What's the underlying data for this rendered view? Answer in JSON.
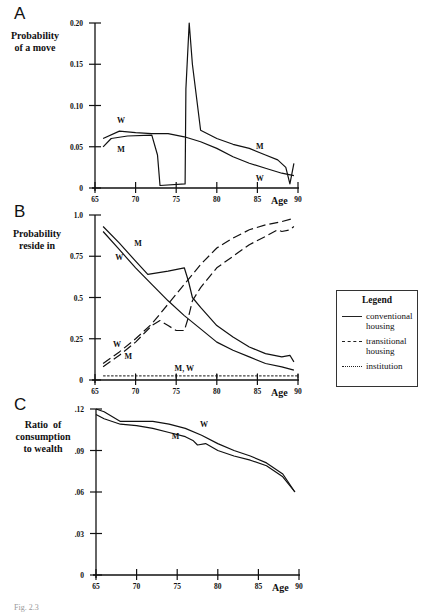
{
  "panels": {
    "A": {
      "letter": "A",
      "ylabel_lines": [
        "Probability",
        "of a move"
      ]
    },
    "B": {
      "letter": "B",
      "ylabel_lines": [
        "Probability",
        "reside in"
      ]
    },
    "C": {
      "letter": "C",
      "ylabel_lines": [
        "Ratio  of",
        "consumption",
        "to wealth"
      ]
    }
  },
  "legend": {
    "title": "Legend",
    "items": [
      {
        "style": "solid",
        "label_lines": [
          "conventional",
          "housing"
        ]
      },
      {
        "style": "dashed",
        "label_lines": [
          "transitional",
          "housing"
        ]
      },
      {
        "style": "dotted",
        "label_lines": [
          "institution"
        ]
      }
    ]
  },
  "chart_data": [
    {
      "type": "line",
      "panel": "A",
      "title": "",
      "ylabel": "Probability of a move",
      "xlabel": "Age",
      "xlim": [
        65,
        90
      ],
      "ylim": [
        0,
        0.2
      ],
      "x_ticks": [
        "65",
        "70",
        "75",
        "80",
        "85",
        "90"
      ],
      "y_ticks": [
        "0",
        "0.05",
        "0.10",
        "0.15",
        "0.20"
      ],
      "grid": false,
      "series": [
        {
          "name": "W",
          "x": [
            66,
            68,
            70,
            72,
            74,
            76,
            78,
            80,
            82,
            84,
            86,
            88,
            89.5
          ],
          "values": [
            0.06,
            0.069,
            0.067,
            0.066,
            0.066,
            0.062,
            0.056,
            0.048,
            0.038,
            0.03,
            0.024,
            0.018,
            0.015
          ]
        },
        {
          "name": "M",
          "x": [
            66,
            67,
            69,
            72,
            72.7,
            73,
            76.1,
            76.2,
            76.6,
            77,
            78,
            80,
            82,
            84,
            86,
            87.5,
            88.5,
            89,
            89.5
          ],
          "values": [
            0.05,
            0.06,
            0.063,
            0.064,
            0.04,
            0.003,
            0.005,
            0.12,
            0.2,
            0.15,
            0.07,
            0.06,
            0.053,
            0.048,
            0.04,
            0.034,
            0.025,
            0.005,
            0.03
          ]
        }
      ]
    },
    {
      "type": "line",
      "panel": "B",
      "ylabel": "Probability reside in",
      "xlabel": "Age",
      "xlim": [
        65,
        90
      ],
      "ylim": [
        0,
        1.0
      ],
      "x_ticks": [
        "65",
        "70",
        "75",
        "80",
        "85",
        "90"
      ],
      "y_ticks": [
        "0",
        "0.25",
        "0.5",
        "0.75",
        "1.0"
      ],
      "grid": false,
      "annotations": [
        "M",
        "W",
        "W",
        "M",
        "M, W"
      ],
      "series": [
        {
          "name": "M conventional housing",
          "style": "solid",
          "x": [
            66,
            68,
            70,
            71.5,
            74,
            76,
            76.5,
            77,
            78,
            80,
            82,
            84,
            86,
            88,
            89,
            89.5
          ],
          "values": [
            0.93,
            0.83,
            0.72,
            0.64,
            0.66,
            0.68,
            0.6,
            0.5,
            0.44,
            0.33,
            0.26,
            0.2,
            0.16,
            0.14,
            0.15,
            0.11
          ]
        },
        {
          "name": "W conventional housing",
          "style": "solid",
          "x": [
            66,
            68,
            70,
            72,
            74,
            76,
            78,
            80,
            82,
            84,
            86,
            88,
            89.5
          ],
          "values": [
            0.9,
            0.79,
            0.68,
            0.58,
            0.48,
            0.39,
            0.31,
            0.23,
            0.18,
            0.14,
            0.1,
            0.08,
            0.06
          ]
        },
        {
          "name": "W transitional housing",
          "style": "dashed",
          "x": [
            66,
            68,
            70,
            72,
            74,
            76,
            78,
            80,
            82,
            84,
            86,
            88,
            89.5
          ],
          "values": [
            0.1,
            0.17,
            0.25,
            0.34,
            0.46,
            0.58,
            0.7,
            0.8,
            0.86,
            0.91,
            0.94,
            0.96,
            0.98
          ]
        },
        {
          "name": "M transitional housing",
          "style": "dashed",
          "x": [
            66,
            68,
            70,
            72,
            73,
            74,
            75,
            76,
            76.5,
            77,
            78,
            80,
            82,
            84,
            86,
            87.5,
            88,
            89,
            89.5
          ],
          "values": [
            0.08,
            0.15,
            0.23,
            0.33,
            0.36,
            0.33,
            0.3,
            0.3,
            0.38,
            0.48,
            0.56,
            0.68,
            0.75,
            0.82,
            0.87,
            0.91,
            0.9,
            0.91,
            0.93
          ]
        },
        {
          "name": "M, W institution",
          "style": "dotted",
          "x": [
            66,
            90
          ],
          "values": [
            0.025,
            0.025
          ]
        }
      ]
    },
    {
      "type": "line",
      "panel": "C",
      "ylabel": "Ratio of consumption to wealth",
      "xlabel": "Age",
      "xlim": [
        65,
        90
      ],
      "ylim": [
        0,
        0.12
      ],
      "x_ticks": [
        "65",
        "70",
        "75",
        "80",
        "85",
        "90"
      ],
      "y_ticks": [
        "0",
        ".03",
        ".06",
        ".09",
        ".12"
      ],
      "grid": false,
      "series": [
        {
          "name": "W",
          "x": [
            65,
            66,
            68,
            70,
            72,
            74,
            76,
            78,
            80,
            82,
            84,
            86,
            88,
            89.5
          ],
          "values": [
            0.12,
            0.118,
            0.111,
            0.111,
            0.111,
            0.109,
            0.106,
            0.101,
            0.095,
            0.09,
            0.086,
            0.081,
            0.073,
            0.06
          ]
        },
        {
          "name": "M",
          "x": [
            65,
            66,
            68,
            70,
            72,
            74,
            76,
            77,
            77.5,
            78.5,
            80,
            82,
            84,
            86,
            88,
            89.5
          ],
          "values": [
            0.116,
            0.113,
            0.109,
            0.108,
            0.106,
            0.103,
            0.1,
            0.097,
            0.094,
            0.095,
            0.09,
            0.086,
            0.083,
            0.079,
            0.071,
            0.06
          ]
        }
      ]
    }
  ],
  "caption": "Fig. 2.3"
}
